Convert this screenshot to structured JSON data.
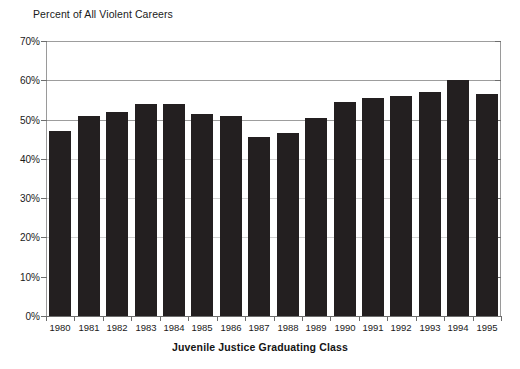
{
  "chart_data": {
    "type": "bar",
    "title": "Percent of All Violent Careers",
    "xlabel": "Juvenile Justice Graduating Class",
    "ylabel": "",
    "categories": [
      "1980",
      "1981",
      "1982",
      "1983",
      "1984",
      "1985",
      "1986",
      "1987",
      "1988",
      "1989",
      "1990",
      "1991",
      "1992",
      "1993",
      "1994",
      "1995"
    ],
    "values": [
      47.0,
      51.0,
      52.0,
      54.0,
      54.0,
      51.5,
      51.0,
      45.5,
      46.5,
      50.5,
      54.5,
      55.5,
      56.0,
      57.0,
      60.0,
      56.5
    ],
    "ylim": [
      0,
      70
    ],
    "ytick_labels": [
      "0%",
      "10%",
      "20%",
      "30%",
      "40%",
      "50%",
      "60%",
      "70%"
    ],
    "ytick_values": [
      0,
      10,
      20,
      30,
      40,
      50,
      60,
      70
    ],
    "grid": true,
    "gridline_values": [
      20,
      30,
      40,
      50,
      60,
      70
    ],
    "legend": null,
    "legend_position": "none",
    "bar_color": "#231f20",
    "axis_color": "#6d6d6d",
    "grid_color": "#9d9d9d",
    "background_color": "#ffffff"
  }
}
